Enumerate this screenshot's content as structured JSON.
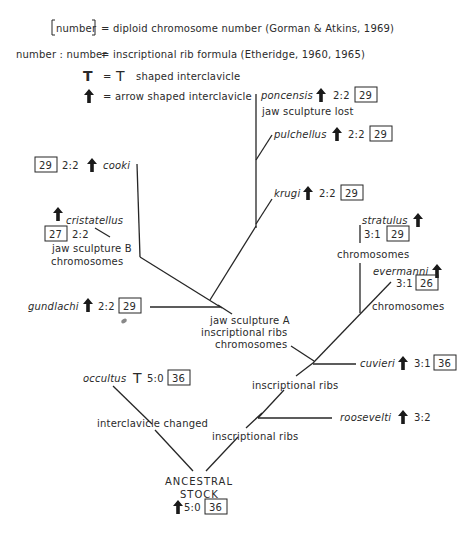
{
  "legend": {
    "chromosome": {
      "symbol": "number",
      "text": "= diploid chromosome number (Gorman & Atkins, 1969)"
    },
    "rib_formula": {
      "symbol": "number : number",
      "text": "= inscriptional rib formula (Etheridge, 1960, 1965)"
    },
    "t_shaped": {
      "symbol": "T",
      "eq": "=",
      "symbol2": "T",
      "text": "shaped interclavicle"
    },
    "arrow_shaped": {
      "symbol": "arrow-icon",
      "text": "= arrow shaped interclavicle"
    }
  },
  "taxa": {
    "poncensis": {
      "name": "poncensis",
      "interclavicle": "arrow",
      "rib": "2:2",
      "chromosomes": "29",
      "note": "jaw sculpture lost"
    },
    "pulchellus": {
      "name": "pulchellus",
      "interclavicle": "arrow",
      "rib": "2:2",
      "chromosomes": "29"
    },
    "krugi": {
      "name": "krugi",
      "interclavicle": "arrow",
      "rib": "2:2",
      "chromosomes": "29"
    },
    "cooki": {
      "name": "cooki",
      "interclavicle": "arrow",
      "rib": "2:2",
      "chromosomes": "29"
    },
    "cristatellus": {
      "name": "cristatellus",
      "interclavicle": "arrow",
      "rib": "2:2",
      "chromosomes": "27",
      "note1": "jaw sculpture B",
      "note2": "chromosomes"
    },
    "gundlachi": {
      "name": "gundlachi",
      "interclavicle": "arrow",
      "rib": "2:2",
      "chromosomes": "29"
    },
    "stratulus": {
      "name": "stratulus",
      "interclavicle": "arrow",
      "rib": "3:1",
      "chromosomes": "29",
      "note": "chromosomes"
    },
    "evermanni": {
      "name": "evermanni",
      "interclavicle": "arrow",
      "rib": "3:1",
      "chromosomes": "26",
      "note": "chromosomes"
    },
    "cuvieri": {
      "name": "cuvieri",
      "interclavicle": "arrow",
      "rib": "3:1",
      "chromosomes": "36"
    },
    "roosevelti": {
      "name": "roosevelti",
      "interclavicle": "arrow",
      "rib": "3:2"
    },
    "occultus": {
      "name": "occultus",
      "interclavicle": "T",
      "rib": "5:0",
      "chromosomes": "36"
    }
  },
  "nodes": {
    "jaw_a": {
      "line1": "jaw sculpture A",
      "line2": "inscriptional ribs",
      "line3": "chromosomes"
    },
    "ribs_upper": {
      "text": "inscriptional ribs"
    },
    "ribs_lower": {
      "text": "inscriptional ribs"
    },
    "interclavicle": {
      "text": "interclavicle changed"
    },
    "ancestral": {
      "line1": "ANCESTRAL",
      "line2": "STOCK",
      "interclavicle": "arrow",
      "rib": "5:0",
      "chromosomes": "36"
    }
  }
}
